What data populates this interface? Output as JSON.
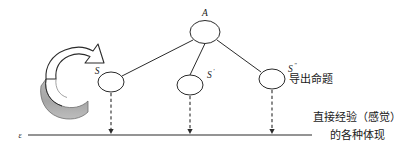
{
  "figure": {
    "background_color": "#ffffff",
    "ink_color": "#2b2b2b",
    "shade_color": "#a8a8a8",
    "nodes": [
      {
        "id": "A",
        "label": "A",
        "cx": 205,
        "cy": 32,
        "rx": 15,
        "ry": 11.5,
        "label_x": 205,
        "label_y": 15,
        "label_anchor": "middle"
      },
      {
        "id": "S",
        "label": "S",
        "cx": 111,
        "cy": 82,
        "rx": 13,
        "ry": 10,
        "label_x": 95,
        "label_y": 74,
        "label_anchor": "middle"
      },
      {
        "id": "S1",
        "label": "S",
        "prime": "'",
        "cx": 190,
        "cy": 85,
        "rx": 13,
        "ry": 10,
        "label_x": 208,
        "label_y": 77,
        "label_anchor": "start"
      },
      {
        "id": "S2",
        "label": "S",
        "prime": "\"",
        "cx": 272,
        "cy": 79,
        "rx": 13,
        "ry": 10,
        "label_x": 288,
        "label_y": 71,
        "label_anchor": "start"
      }
    ],
    "edges": [
      {
        "from": "A",
        "to": "S"
      },
      {
        "from": "A",
        "to": "S1"
      },
      {
        "from": "A",
        "to": "S2"
      }
    ],
    "projections": [
      {
        "from": "S",
        "x": 111,
        "y1": 93,
        "y2": 133
      },
      {
        "from": "S1",
        "x": 190,
        "y1": 96,
        "y2": 133
      },
      {
        "from": "S2",
        "x": 272,
        "y1": 90,
        "y2": 133
      }
    ],
    "baseline": {
      "x1": 28,
      "x2": 312,
      "y": 135
    },
    "axis_symbol": {
      "text": "ε",
      "x": 21,
      "y": 138
    },
    "annotations": [
      {
        "id": "derived",
        "text": "导出命题",
        "x": 289,
        "y": 82,
        "anchor": "start"
      },
      {
        "id": "experience1",
        "text": "直接经验（感觉）",
        "x": 357,
        "y": 121,
        "anchor": "middle"
      },
      {
        "id": "experience2",
        "text": "的各种体现",
        "x": 357,
        "y": 139,
        "anchor": "middle"
      }
    ],
    "curved_arrow": {
      "name": "rotation-arrow",
      "description": "curved 3D arrow sweeping upward to the right",
      "outline_color": "#2b2b2b",
      "face_color": "#ffffff",
      "shade_color": "#a8a8a8"
    }
  }
}
